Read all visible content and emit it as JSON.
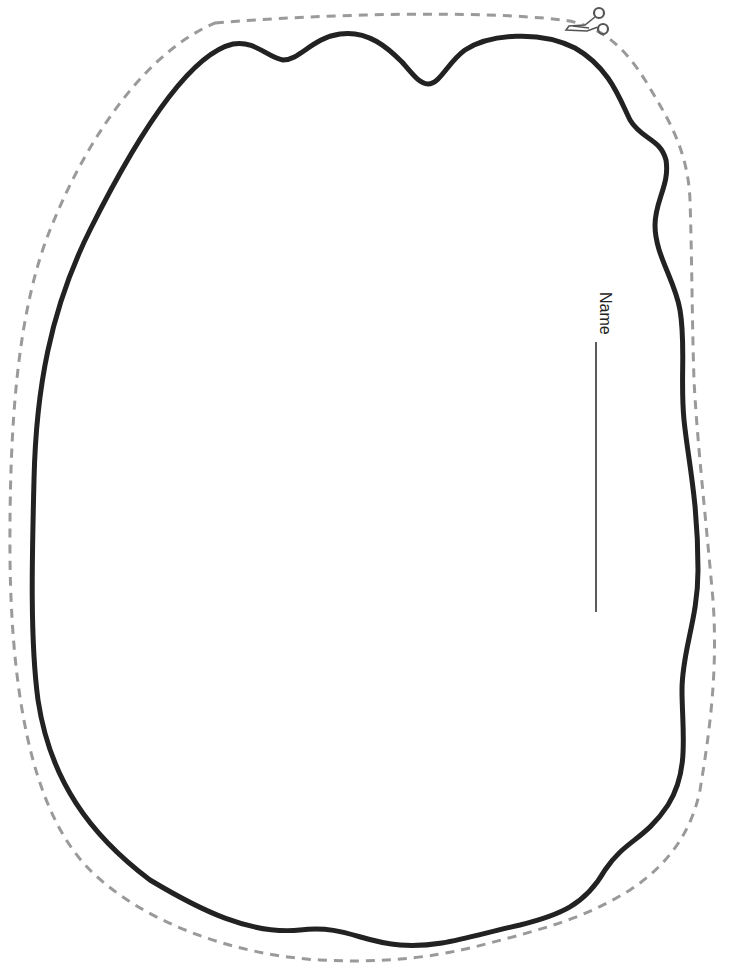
{
  "worksheet": {
    "name_label": "Name",
    "name_line_blank": "",
    "icons": {
      "scissors": "scissors-icon"
    },
    "colors": {
      "background": "#ffffff",
      "outline": "#222222",
      "cut_line": "#9a9a9a",
      "text": "#222222",
      "scissors": "#555555"
    }
  }
}
